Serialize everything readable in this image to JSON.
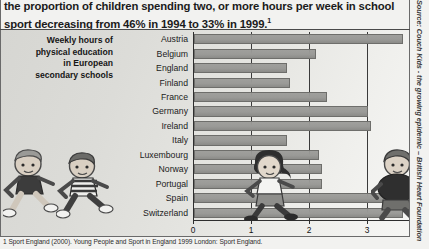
{
  "document": {
    "top_paragraph": "the proportion of children spending two, or more hours per week in school sport decreasing from 46% in 1994 to 33% in 1999.",
    "top_paragraph_footnote_marker": "1",
    "source_note": "Source: Couch Kids - the growing epidemic – British Heart Foundation",
    "footnote": "1 Sport England (2000). Young People and Sport in England 1999 London: Sport England."
  },
  "chart_data": {
    "type": "bar",
    "orientation": "horizontal",
    "title": "Weekly hours of physical education in European secondary schools",
    "title_lines": [
      "Weekly hours of",
      "physical education",
      "in European",
      "secondary schools"
    ],
    "xlabel": "",
    "ylabel": "",
    "xlim": [
      0,
      4
    ],
    "xticks": [
      0,
      1,
      2,
      3,
      4
    ],
    "xtick_labels": [
      "0",
      "1",
      "2",
      "3",
      "4"
    ],
    "grid": true,
    "legend": "none",
    "bar_color": "#9a9a97",
    "categories": [
      "Austria",
      "Belgium",
      "England",
      "Finland",
      "France",
      "Germany",
      "Ireland",
      "Italy",
      "Luxembourg",
      "Norway",
      "Portugal",
      "Spain",
      "Switzerland"
    ],
    "values": [
      3.6,
      2.1,
      1.6,
      1.65,
      2.3,
      3.0,
      3.05,
      1.6,
      2.15,
      2.2,
      2.2,
      3.6,
      3.6
    ]
  },
  "illustrations": {
    "kids": [
      "running-child-left-1",
      "running-child-left-2",
      "running-child-center",
      "running-child-right"
    ]
  }
}
